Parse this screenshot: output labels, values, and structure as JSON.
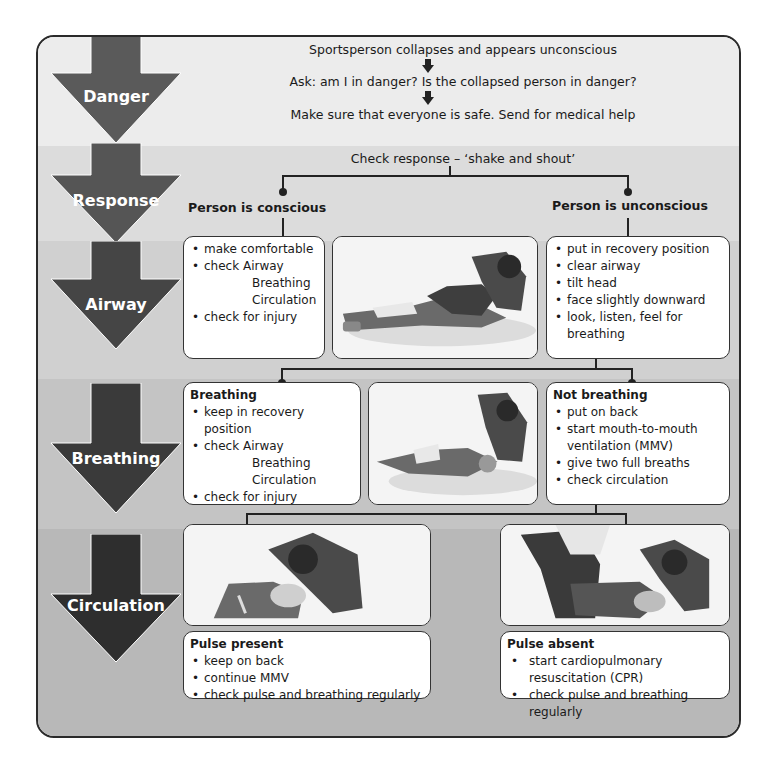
{
  "diagram": {
    "stages": [
      {
        "label": "Danger"
      },
      {
        "label": "Response"
      },
      {
        "label": "Airway"
      },
      {
        "label": "Breathing"
      },
      {
        "label": "Circulation"
      }
    ],
    "danger": {
      "step1": "Sportsperson collapses and appears unconscious",
      "step2": "Ask: am I in danger? Is the collapsed person in danger?",
      "step3": "Make sure that everyone is safe. Send for medical help"
    },
    "response": {
      "check": "Check response – ‘shake and shout’",
      "conscious": "Person is conscious",
      "unconscious": "Person is unconscious"
    },
    "airway": {
      "conscious_box": {
        "items": [
          "make comfortable",
          "check  Airway"
        ],
        "sub_items": [
          "Breathing",
          "Circulation"
        ],
        "last_item": "check for injury"
      },
      "image": "recovery-position-illustration",
      "unconscious_box": {
        "items": [
          "put in recovery position",
          "clear airway",
          "tilt head",
          "face slightly downward",
          "look, listen, feel for breathing"
        ]
      }
    },
    "breathing": {
      "breathing_box": {
        "title": "Breathing",
        "items": [
          "keep in recovery position",
          "check  Airway"
        ],
        "sub_items": [
          "Breathing",
          "Circulation"
        ],
        "last_item": "check for injury"
      },
      "image": "recovery-position-check-illustration",
      "not_breathing_box": {
        "title": "Not breathing",
        "items": [
          "put on back",
          "start mouth-to-mouth ventilation (MMV)",
          "give two full breaths",
          "check circulation"
        ]
      }
    },
    "circulation": {
      "pulse_present": {
        "image": "mouth-to-mouth-illustration",
        "title": "Pulse present",
        "items": [
          "keep on back",
          "continue MMV",
          "check pulse and breathing regularly"
        ]
      },
      "pulse_absent": {
        "image": "cpr-two-rescuers-illustration",
        "title": "Pulse absent",
        "items": [
          "start cardiopulmonary resuscitation (CPR)",
          "check pulse and breathing regularly"
        ]
      }
    },
    "colors": {
      "arrow": "#4a4a4a",
      "arrow_dark": "#2e2e2e",
      "frame_border": "#2a2a2a",
      "connector": "#222222"
    }
  }
}
